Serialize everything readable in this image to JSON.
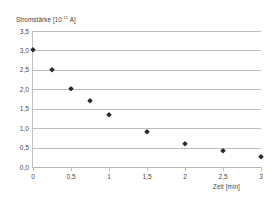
{
  "chart_data": {
    "type": "scatter",
    "title": "",
    "xlabel": "Zeit [min]",
    "ylabel": "Stromstärke [10-11 A]",
    "ylabel_main": "Stromstärke [10",
    "ylabel_exponent": "-11",
    "ylabel_tail": " A]",
    "xlim": [
      0,
      3
    ],
    "ylim": [
      0,
      3.5
    ],
    "grid": true,
    "legend": "none",
    "x": [
      0,
      0.25,
      0.5,
      0.75,
      1,
      1.5,
      2,
      2.5,
      3
    ],
    "values": [
      3.0,
      2.5,
      2.0,
      1.7,
      1.35,
      0.9,
      0.6,
      0.4,
      0.25
    ],
    "marker_color": "#2b2b2b",
    "grid_color": "#bdbdbd",
    "ytick_labels": [
      "0,0",
      "0,5",
      "1,0",
      "1,5",
      "2,0",
      "2,5",
      "3,0",
      "3,5"
    ],
    "ytick_values": [
      0,
      0.5,
      1.0,
      1.5,
      2.0,
      2.5,
      3.0,
      3.5
    ],
    "xtick_labels": [
      "0",
      "0,5",
      "1",
      "1,5",
      "2",
      "2,5",
      "3"
    ],
    "xtick_values": [
      0,
      0.5,
      1.0,
      1.5,
      2.0,
      2.5,
      3.0
    ]
  }
}
